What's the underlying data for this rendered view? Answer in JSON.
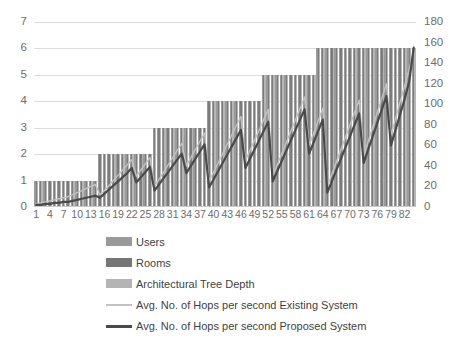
{
  "axes": {
    "left_ticks": [
      0,
      1,
      2,
      3,
      4,
      5,
      6,
      7
    ],
    "right_ticks": [
      0,
      20,
      40,
      60,
      80,
      100,
      120,
      140,
      160,
      180
    ],
    "left_min": 0,
    "left_max": 7,
    "right_min": 0,
    "right_max": 180,
    "x_tick_labels": [
      "1",
      "4",
      "7",
      "10",
      "13",
      "16",
      "19",
      "22",
      "25",
      "28",
      "31",
      "34",
      "37",
      "40",
      "43",
      "46",
      "49",
      "52",
      "55",
      "58",
      "61",
      "64",
      "67",
      "70",
      "73",
      "76",
      "79",
      "82"
    ]
  },
  "legend": {
    "items": [
      {
        "label": "Users",
        "type": "bar",
        "color": "#9a9a9a",
        "swatch": "users"
      },
      {
        "label": "Rooms",
        "type": "bar",
        "color": "#767676",
        "swatch": "rooms"
      },
      {
        "label": "Architectural Tree Depth",
        "type": "bar",
        "color": "#b4b4b4",
        "swatch": "depth"
      },
      {
        "label": "Avg. No. of Hops per second  Existing System",
        "type": "line",
        "color": "#c2c2c2",
        "swatch": "existing"
      },
      {
        "label": "Avg. No. of Hops per second  Proposed System",
        "type": "line",
        "color": "#4a4a4a",
        "swatch": "proposed"
      }
    ]
  },
  "chart_data": {
    "type": "bar",
    "title": "",
    "xlabel": "",
    "ylabel": "",
    "y2label": "",
    "ylim": [
      0,
      7
    ],
    "y2lim": [
      0,
      180
    ],
    "grid": true,
    "legend_position": "bottom-left",
    "categories": [
      1,
      2,
      3,
      4,
      5,
      6,
      7,
      8,
      9,
      10,
      11,
      12,
      13,
      14,
      15,
      16,
      17,
      18,
      19,
      20,
      21,
      22,
      23,
      24,
      25,
      26,
      27,
      28,
      29,
      30,
      31,
      32,
      33,
      34,
      35,
      36,
      37,
      38,
      39,
      40,
      41,
      42,
      43,
      44,
      45,
      46,
      47,
      48,
      49,
      50,
      51,
      52,
      53,
      54,
      55,
      56,
      57,
      58,
      59,
      60,
      61,
      62,
      63,
      64,
      65,
      66,
      67,
      68,
      69,
      70,
      71,
      72,
      73,
      74,
      75,
      76,
      77,
      78,
      79,
      80,
      81,
      82,
      83,
      84
    ],
    "series": [
      {
        "name": "Users",
        "axis": "left",
        "kind": "bar",
        "color": "#9a9a9a",
        "values": [
          1,
          1,
          1,
          1,
          1,
          1,
          1,
          1,
          1,
          1,
          1,
          1,
          1,
          1,
          2,
          2,
          2,
          2,
          2,
          2,
          2,
          2,
          2,
          2,
          2,
          2,
          3,
          3,
          3,
          3,
          3,
          3,
          3,
          3,
          3,
          3,
          3,
          3,
          4,
          4,
          4,
          4,
          4,
          4,
          4,
          4,
          4,
          4,
          4,
          4,
          5,
          5,
          5,
          5,
          5,
          5,
          5,
          5,
          5,
          5,
          5,
          5,
          6,
          6,
          6,
          6,
          6,
          6,
          6,
          6,
          6,
          6,
          6,
          6,
          6,
          6,
          6,
          6,
          6,
          6,
          6,
          6,
          6,
          6
        ]
      },
      {
        "name": "Rooms",
        "axis": "left",
        "kind": "bar",
        "color": "#767676",
        "values": [
          1,
          1,
          1,
          1,
          1,
          1,
          1,
          1,
          1,
          1,
          1,
          1,
          1,
          1,
          2,
          2,
          2,
          2,
          2,
          2,
          2,
          2,
          2,
          2,
          2,
          2,
          3,
          3,
          3,
          3,
          3,
          3,
          3,
          3,
          3,
          3,
          3,
          3,
          4,
          4,
          4,
          4,
          4,
          4,
          4,
          4,
          4,
          4,
          4,
          4,
          5,
          5,
          5,
          5,
          5,
          5,
          5,
          5,
          5,
          5,
          5,
          5,
          6,
          6,
          6,
          6,
          6,
          6,
          6,
          6,
          6,
          6,
          6,
          6,
          6,
          6,
          6,
          6,
          6,
          6,
          6,
          6,
          6,
          6
        ]
      },
      {
        "name": "Architectural Tree Depth",
        "axis": "left",
        "kind": "bar",
        "color": "#b4b4b4",
        "values": [
          1,
          1,
          1,
          1,
          1,
          1,
          1,
          1,
          1,
          1,
          1,
          1,
          1,
          1,
          2,
          2,
          2,
          2,
          2,
          2,
          2,
          2,
          2,
          2,
          2,
          2,
          3,
          3,
          3,
          3,
          3,
          3,
          3,
          3,
          3,
          3,
          3,
          3,
          4,
          4,
          4,
          4,
          4,
          4,
          4,
          4,
          4,
          4,
          4,
          4,
          5,
          5,
          5,
          5,
          5,
          5,
          5,
          5,
          5,
          5,
          5,
          5,
          6,
          6,
          6,
          6,
          6,
          6,
          6,
          6,
          6,
          6,
          6,
          6,
          6,
          6,
          6,
          6,
          6,
          6,
          6,
          6,
          6,
          6
        ]
      },
      {
        "name": "Avg. No. of Hops per second  Existing System",
        "axis": "right",
        "kind": "line",
        "color": "#c2c2c2",
        "values": [
          3,
          4,
          5,
          6,
          7,
          8,
          9,
          10,
          12,
          14,
          16,
          18,
          20,
          22,
          12,
          16,
          21,
          26,
          31,
          36,
          41,
          46,
          30,
          36,
          42,
          48,
          20,
          27,
          34,
          41,
          48,
          55,
          62,
          40,
          48,
          56,
          64,
          72,
          25,
          34,
          43,
          52,
          61,
          70,
          79,
          88,
          45,
          55,
          65,
          75,
          85,
          95,
          30,
          41,
          52,
          63,
          74,
          85,
          96,
          107,
          60,
          72,
          84,
          96,
          20,
          32,
          44,
          56,
          68,
          80,
          92,
          104,
          50,
          64,
          78,
          92,
          106,
          120,
          70,
          86,
          102,
          118,
          134,
          152
        ]
      },
      {
        "name": "Avg. No. of Hops per second  Proposed System",
        "axis": "right",
        "kind": "line",
        "color": "#4a4a4a",
        "values": [
          2,
          2,
          3,
          3,
          4,
          4,
          5,
          5,
          6,
          7,
          8,
          9,
          10,
          11,
          9,
          13,
          17,
          21,
          25,
          29,
          33,
          38,
          24,
          29,
          34,
          39,
          16,
          22,
          28,
          34,
          40,
          46,
          52,
          33,
          40,
          47,
          54,
          61,
          19,
          27,
          35,
          43,
          51,
          59,
          67,
          75,
          38,
          47,
          56,
          65,
          74,
          83,
          25,
          35,
          45,
          55,
          65,
          75,
          85,
          95,
          52,
          63,
          74,
          85,
          14,
          25,
          36,
          47,
          58,
          69,
          80,
          91,
          43,
          56,
          69,
          82,
          95,
          108,
          60,
          75,
          90,
          105,
          122,
          155
        ]
      }
    ]
  }
}
